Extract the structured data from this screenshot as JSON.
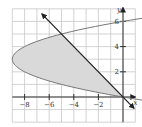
{
  "chart_data": {
    "type": "line",
    "title": "",
    "xlabel": "x",
    "ylabel": "y",
    "xlim": [
      -9.2,
      1.0
    ],
    "ylim": [
      -2.0,
      7.0
    ],
    "grid": true,
    "grid_step": 1,
    "x_ticks": [
      -8,
      -6,
      -4,
      -2
    ],
    "x_tick_labels": [
      "−8",
      "−6",
      "−4",
      "−2"
    ],
    "y_ticks": [
      2,
      4,
      6
    ],
    "y_tick_labels": [
      "2",
      "4",
      "6"
    ],
    "series": [
      {
        "name": "parabola x = y^2 - 6y",
        "kind": "curve",
        "equation": "x = y^2 - 6y",
        "vertex": [
          -9,
          3
        ],
        "y_range": [
          -1.2,
          6.6
        ],
        "color": "#777777"
      },
      {
        "name": "line y = -x",
        "kind": "line",
        "equation": "y = -x",
        "points": [
          [
            -6.6,
            6.6
          ],
          [
            0.9,
            -0.9
          ]
        ],
        "arrows": "both",
        "color": "#222222"
      }
    ],
    "shaded_region": {
      "description": "region bounded by parabola and line",
      "intersections": [
        [
          0,
          0
        ],
        [
          -5,
          5
        ]
      ],
      "fill": "#d9d9d9"
    }
  },
  "colors": {
    "grid": "#c8c8c8",
    "axis": "#333333",
    "shade": "#d9d9d9",
    "curve": "#777777",
    "line": "#222222"
  }
}
